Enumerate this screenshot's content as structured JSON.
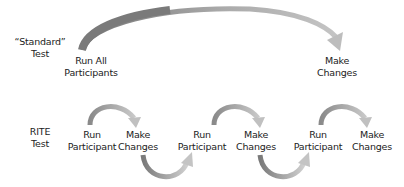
{
  "rows": {
    "standard": {
      "label_line1": "“Standard”",
      "label_line2": "Test",
      "steps": [
        {
          "line1": "Run All",
          "line2": "Participants"
        },
        {
          "line1": "Make",
          "line2": "Changes"
        }
      ]
    },
    "rite": {
      "label_line1": "RITE",
      "label_line2": "Test",
      "steps": [
        {
          "line1": "Run",
          "line2": "Participant"
        },
        {
          "line1": "Make",
          "line2": "Changes"
        },
        {
          "line1": "Run",
          "line2": "Participant"
        },
        {
          "line1": "Make",
          "line2": "Changes"
        },
        {
          "line1": "Run",
          "line2": "Participant"
        },
        {
          "line1": "Make",
          "line2": "Changes"
        }
      ]
    }
  },
  "colors": {
    "arrow_dark": "#777777",
    "arrow_light": "#d8d8d8",
    "text": "#222222",
    "background": "#ffffff"
  }
}
